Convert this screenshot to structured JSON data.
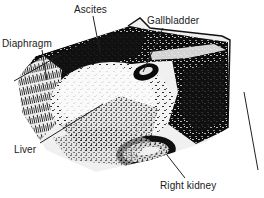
{
  "figure": {
    "kind": "ultrasound-scan-diagram",
    "colors": {
      "background": "#ffffff",
      "ink": "#000000",
      "label_text": "#1a1a1a",
      "leader_line": "#222222",
      "tissue_light": "#f2f2f2",
      "tissue_mid": "#8a8a8a",
      "tissue_dark": "#141414"
    },
    "labels": [
      {
        "id": "ascites",
        "text": "Ascites",
        "x": 74,
        "y": 4
      },
      {
        "id": "diaphragm",
        "text": "Diaphragm",
        "x": 2,
        "y": 38
      },
      {
        "id": "gallbladder",
        "text": "Gallbladder",
        "x": 147,
        "y": 15
      },
      {
        "id": "liver",
        "text": "Liver",
        "x": 14,
        "y": 144
      },
      {
        "id": "right_kidney",
        "text": "Right kidney",
        "x": 160,
        "y": 180
      }
    ],
    "leader_lines": [
      {
        "id": "ascites-leader",
        "from": [
          93,
          16
        ],
        "to": [
          100,
          52
        ]
      },
      {
        "id": "diaphragm-leader",
        "from": [
          42,
          50
        ],
        "to": [
          47,
          80
        ]
      },
      {
        "id": "gallbladder-leader",
        "from": [
          163,
          28
        ],
        "to": [
          143,
          72
        ]
      },
      {
        "id": "liver-leader",
        "from": [
          40,
          143
        ],
        "to": [
          103,
          104
        ]
      },
      {
        "id": "right-kidney-leader",
        "from": [
          185,
          178
        ],
        "to": [
          167,
          155
        ]
      },
      {
        "id": "diaphragm-plane-line",
        "from": [
          14,
          81
        ],
        "to": [
          60,
          55
        ]
      },
      {
        "id": "lower-right-marker-line",
        "from": [
          244,
          92
        ],
        "to": [
          258,
          170
        ]
      }
    ]
  }
}
